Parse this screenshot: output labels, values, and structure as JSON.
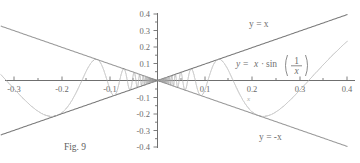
{
  "caption": {
    "text": "Fig. 9"
  },
  "chart_data": {
    "type": "line",
    "title": "",
    "subtitle": "",
    "xlabel": "",
    "ylabel": "",
    "xlim": [
      -0.33,
      0.4
    ],
    "ylim": [
      -0.4,
      0.4
    ],
    "grid": false,
    "legend_position": "inline-annotations",
    "x_ticks": [
      -0.3,
      -0.2,
      -0.1,
      0.1,
      0.2,
      0.3,
      0.4
    ],
    "x_tick_labels": [
      "-0.3",
      "-0.2",
      "-0.1",
      "0.1",
      "0.2",
      "0.3",
      "0.4"
    ],
    "x_minor_ticks": [
      -0.25,
      -0.15,
      -0.05,
      0.05,
      0.15,
      0.25,
      0.35
    ],
    "y_ticks": [
      0.4,
      0.3,
      0.2,
      0.1,
      -0.1,
      -0.2,
      -0.3,
      -0.4
    ],
    "y_tick_labels": [
      "0.4",
      "0.3",
      "0.2",
      "0.1",
      "-0.1",
      "-0.2",
      "-0.3",
      "-0.4"
    ],
    "y_minor_ticks": [
      0.35,
      0.25,
      0.15,
      0.05,
      -0.05,
      -0.15,
      -0.25,
      -0.35
    ],
    "series": [
      {
        "name": "y = x · sin(1/x)",
        "expression": "x*sin(1/x)",
        "color": "#b0b0b0",
        "style": "solid",
        "x_domain": [
          -0.33,
          0.4
        ]
      },
      {
        "name": "y = x",
        "expression": "x",
        "color": "#7a7a7a",
        "style": "solid",
        "x_domain": [
          -0.33,
          0.4
        ]
      },
      {
        "name": "y = -x",
        "expression": "-x",
        "color": "#9a9a9a",
        "style": "solid",
        "x_domain": [
          -0.33,
          0.4
        ]
      }
    ],
    "annotations": [
      {
        "id": "label-y-equals-x",
        "text": "y = x",
        "x": 0.22,
        "y": 0.33
      },
      {
        "id": "label-y-equals-minus-x",
        "text": "y = -x",
        "x": 0.23,
        "y": -0.33
      },
      {
        "id": "label-point-x",
        "text": "x",
        "x": 0.205,
        "y": -0.115
      }
    ],
    "function_label": {
      "lhs": "y",
      "equals": "=",
      "factor": "x",
      "dot": "·",
      "fn": "sin",
      "numerator": "1",
      "denominator": "x",
      "paren_open": "(",
      "paren_close": ")",
      "full": "y = x · sin(1/x)",
      "x": 0.135,
      "y": 0.155
    }
  },
  "colors": {
    "axis": "#6f6f6f",
    "curve": "#b0b0b0",
    "line_y_eq_x": "#7a7a7a",
    "line_y_eq_minus_x": "#9a9a9a",
    "text": "#6b6b6b",
    "background": "#ffffff"
  }
}
